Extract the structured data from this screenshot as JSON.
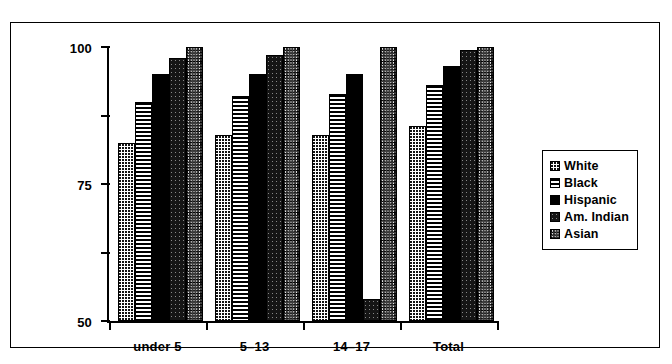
{
  "chart_data": {
    "type": "bar",
    "title": "",
    "subtitle": "",
    "xlabel": "",
    "ylabel": "",
    "categories": [
      "under 5",
      "5–13",
      "14–17",
      "Total"
    ],
    "series": [
      {
        "name": "White",
        "pattern": "light-dotted",
        "values": [
          65,
          68,
          68,
          71
        ]
      },
      {
        "name": "Black",
        "pattern": "horizontal-lines",
        "values": [
          80,
          82,
          83,
          86
        ]
      },
      {
        "name": "Hispanic",
        "pattern": "solid-black",
        "values": [
          90,
          90,
          90,
          93
        ]
      },
      {
        "name": "Am. Indian",
        "pattern": "dark-dotted",
        "values": [
          96,
          97,
          8,
          99
        ]
      },
      {
        "name": "Asian",
        "pattern": "gray-crosshatch",
        "values": [
          100,
          100,
          100,
          100
        ]
      }
    ],
    "ylim": [
      0,
      100
    ],
    "yticks": [
      0,
      25,
      50,
      75,
      100
    ],
    "ytick_labels": [
      "0",
      "25",
      "50",
      "75",
      "100"
    ],
    "grid": false,
    "legend_position": "right",
    "legend_entries": [
      "White",
      "Black",
      "Hispanic",
      "Am. Indian",
      "Asian"
    ],
    "annotations": []
  },
  "colors": {
    "axis": "#000000",
    "frame": "#000000",
    "background": "#ffffff"
  }
}
